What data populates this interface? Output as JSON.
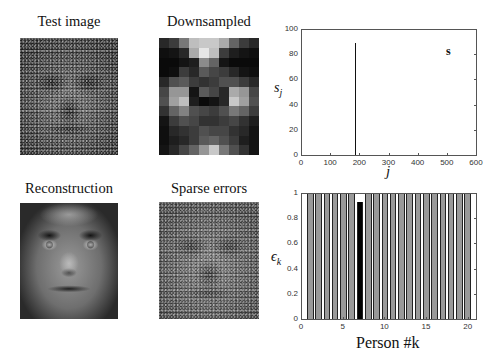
{
  "panels": {
    "test_image": {
      "title": "Test image"
    },
    "downsampled": {
      "title": "Downsampled",
      "grid_cols": 10,
      "grid_rows": 12,
      "grid": [
        [
          40,
          60,
          120,
          190,
          200,
          200,
          170,
          100,
          60,
          40
        ],
        [
          15,
          20,
          40,
          170,
          230,
          190,
          60,
          30,
          20,
          15
        ],
        [
          10,
          10,
          20,
          30,
          140,
          100,
          20,
          10,
          10,
          10
        ],
        [
          10,
          15,
          60,
          40,
          90,
          70,
          60,
          40,
          20,
          15
        ],
        [
          40,
          80,
          90,
          60,
          50,
          60,
          80,
          80,
          60,
          40
        ],
        [
          70,
          150,
          150,
          20,
          90,
          70,
          40,
          170,
          150,
          70
        ],
        [
          80,
          160,
          190,
          30,
          10,
          20,
          40,
          200,
          160,
          80
        ],
        [
          50,
          100,
          130,
          80,
          70,
          60,
          80,
          120,
          100,
          60
        ],
        [
          20,
          60,
          80,
          70,
          50,
          50,
          60,
          70,
          50,
          30
        ],
        [
          15,
          40,
          50,
          60,
          80,
          70,
          70,
          50,
          40,
          20
        ],
        [
          15,
          30,
          40,
          60,
          90,
          100,
          80,
          60,
          30,
          20
        ],
        [
          20,
          40,
          70,
          100,
          150,
          200,
          120,
          80,
          50,
          20
        ]
      ]
    },
    "reconstruction": {
      "title": "Reconstruction"
    },
    "sparse_errors": {
      "title": "Sparse errors"
    }
  },
  "chart_data": [
    {
      "type": "line",
      "title": "",
      "annotation": "s",
      "xlabel": "j",
      "ylabel": "s_j",
      "xlim": [
        0,
        600
      ],
      "ylim": [
        0,
        100
      ],
      "xticks": [
        0,
        100,
        200,
        300,
        400,
        500,
        600
      ],
      "yticks": [
        0,
        20,
        40,
        60,
        80,
        100
      ],
      "grid": false,
      "series": [
        {
          "name": "s",
          "description": "sparse coefficient vector; single dominant spike",
          "x": [
            182
          ],
          "values": [
            90
          ]
        }
      ]
    },
    {
      "type": "bar",
      "title": "",
      "xlabel": "Person #k",
      "ylabel": "ε_k",
      "xlim": [
        0,
        21
      ],
      "ylim": [
        0,
        1
      ],
      "xticks": [
        0,
        5,
        10,
        15,
        20
      ],
      "yticks": [
        0,
        0.2,
        0.4,
        0.6,
        0.8,
        1
      ],
      "grid": false,
      "categories": [
        1,
        2,
        3,
        4,
        5,
        6,
        7,
        8,
        9,
        10,
        11,
        12,
        13,
        14,
        15,
        16,
        17,
        18,
        19,
        20
      ],
      "values": [
        1,
        1,
        1,
        1,
        1,
        1,
        0.94,
        1,
        1,
        1,
        1,
        1,
        1,
        1,
        1,
        1,
        1,
        1,
        1,
        1
      ],
      "highlight_index": 7,
      "colors": {
        "default": "#999999",
        "highlight": "#000000"
      }
    }
  ],
  "labels": {
    "top_annotation": "s",
    "top_xlabel": "j",
    "top_ylabel_main": "s",
    "top_ylabel_sub": "j",
    "bottom_xlabel": "Person #k",
    "bottom_ylabel_main": "ϵ",
    "bottom_ylabel_sub": "k",
    "top_xticks": [
      "0",
      "100",
      "200",
      "300",
      "400",
      "500",
      "600"
    ],
    "top_yticks": [
      "0",
      "20",
      "40",
      "60",
      "80",
      "100"
    ],
    "bottom_xticks": [
      "0",
      "5",
      "10",
      "15",
      "20"
    ],
    "bottom_yticks": [
      "0",
      "0.2",
      "0.4",
      "0.6",
      "0.8",
      "1"
    ]
  }
}
